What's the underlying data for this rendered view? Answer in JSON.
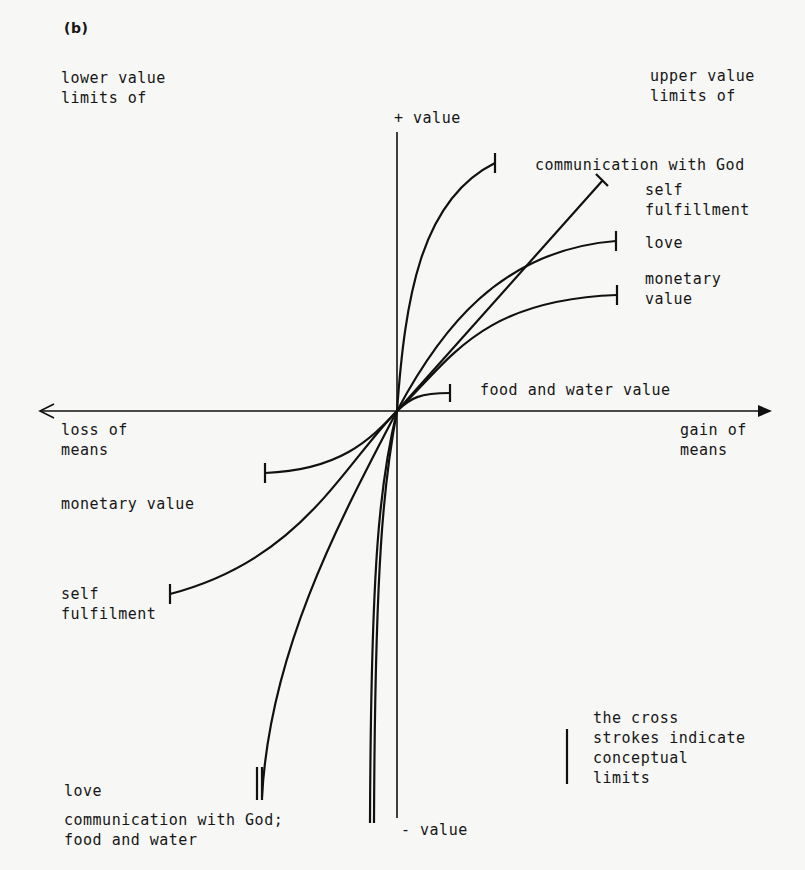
{
  "figure": {
    "panel_label": "(b)",
    "corner_labels": {
      "top_left": "lower value\nlimits of",
      "top_right": "upper value\nlimits of"
    },
    "axes": {
      "y_positive": "+ value",
      "y_negative": "- value",
      "x_positive": "gain of\nmeans",
      "x_negative": "loss of\nmeans"
    },
    "upper_curves": [
      {
        "name": "communication with God",
        "label": "communication with God"
      },
      {
        "name": "self fulfillment",
        "label": "self\nfulfillment"
      },
      {
        "name": "love",
        "label": "love"
      },
      {
        "name": "monetary value",
        "label": "monetary\nvalue"
      },
      {
        "name": "food and water value",
        "label": "food and water value"
      }
    ],
    "lower_curves": [
      {
        "name": "monetary value",
        "label": "monetary value"
      },
      {
        "name": "self fulfilment",
        "label": "self\nfulfilment"
      },
      {
        "name": "love",
        "label": "love"
      },
      {
        "name": "communication with God; food and water",
        "label": "communication with God;\nfood and water"
      }
    ],
    "legend": {
      "text": "the cross\nstrokes indicate\nconceptual\nlimits"
    }
  }
}
